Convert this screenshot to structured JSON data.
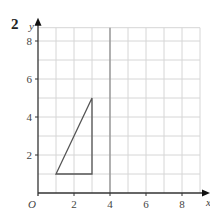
{
  "question_number": "2",
  "chart_data": {
    "type": "line",
    "title": "",
    "xlabel": "x",
    "ylabel": "y",
    "origin_label": "O",
    "xlim": [
      0,
      9
    ],
    "ylim": [
      0,
      8.7
    ],
    "grid": true,
    "x_ticks": [
      "2",
      "4",
      "6",
      "8"
    ],
    "y_ticks": [
      "2",
      "4",
      "6",
      "8"
    ],
    "series": [
      {
        "name": "triangle",
        "closed": true,
        "points": [
          [
            1,
            1
          ],
          [
            3,
            1
          ],
          [
            3,
            5
          ]
        ]
      }
    ],
    "highlight_line": {
      "axis": "x",
      "value": 4
    },
    "colors": {
      "grid": "#d6d6d6",
      "axis": "#333333",
      "shape": "#555555",
      "highlight": "#888888"
    }
  }
}
